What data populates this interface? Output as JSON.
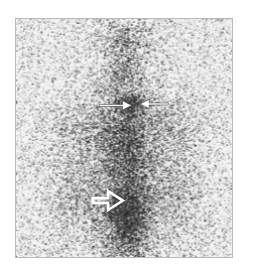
{
  "image": {
    "modality": "scintigraphy",
    "view": "anterior whole-body / torso",
    "frame": {
      "x": 15,
      "y": 18,
      "width": 218,
      "height": 240,
      "border_color": "#b9b9b9"
    },
    "background_color": "#ffffff",
    "field_background": "#f2f2f2"
  },
  "scan": {
    "noise": {
      "grain": "speckle",
      "density": 0.52,
      "dark_color": "#1c1c1c",
      "light_color": "#fdfdfd"
    },
    "anatomy": [
      {
        "name": "head",
        "cx": 0.5,
        "cy": 0.09,
        "rx": 0.115,
        "ry": 0.085,
        "intensity": 0.3
      },
      {
        "name": "neck",
        "cx": 0.5,
        "cy": 0.23,
        "rx": 0.075,
        "ry": 0.085,
        "intensity": 0.34
      },
      {
        "name": "thyroid-focus",
        "cx": 0.525,
        "cy": 0.355,
        "rx": 0.075,
        "ry": 0.035,
        "intensity": 0.78
      },
      {
        "name": "upper-thorax",
        "cx": 0.5,
        "cy": 0.46,
        "rx": 0.255,
        "ry": 0.155,
        "intensity": 0.33
      },
      {
        "name": "mediastinum-spine",
        "cx": 0.515,
        "cy": 0.56,
        "rx": 0.105,
        "ry": 0.255,
        "intensity": 0.44
      },
      {
        "name": "abdomen",
        "cx": 0.5,
        "cy": 0.72,
        "rx": 0.285,
        "ry": 0.215,
        "intensity": 0.31
      },
      {
        "name": "pelvic-bladder-focus",
        "cx": 0.505,
        "cy": 0.805,
        "rx": 0.095,
        "ry": 0.085,
        "intensity": 0.8
      },
      {
        "name": "lower-spine-column",
        "cx": 0.515,
        "cy": 0.92,
        "rx": 0.1,
        "ry": 0.135,
        "intensity": 0.55
      },
      {
        "name": "left-shoulder",
        "cx": 0.245,
        "cy": 0.46,
        "rx": 0.115,
        "ry": 0.105,
        "intensity": 0.17
      },
      {
        "name": "right-shoulder",
        "cx": 0.765,
        "cy": 0.46,
        "rx": 0.115,
        "ry": 0.105,
        "intensity": 0.17
      },
      {
        "name": "left-flank",
        "cx": 0.255,
        "cy": 0.75,
        "rx": 0.12,
        "ry": 0.165,
        "intensity": 0.18
      },
      {
        "name": "right-flank",
        "cx": 0.76,
        "cy": 0.75,
        "rx": 0.12,
        "ry": 0.165,
        "intensity": 0.18
      }
    ]
  },
  "annotations": {
    "arrows": [
      {
        "id": "arrow-left-solid",
        "style": "solid",
        "color": "#ffffff",
        "direction": "right",
        "tail": {
          "x": 0.385,
          "y": 0.363
        },
        "tip": {
          "x": 0.535,
          "y": 0.363
        },
        "points_at": "thyroid-focus"
      },
      {
        "id": "arrow-right-solid",
        "style": "solid",
        "color": "#ffffff",
        "direction": "left",
        "tail": {
          "x": 0.705,
          "y": 0.357
        },
        "tip": {
          "x": 0.575,
          "y": 0.357
        },
        "points_at": "thyroid-focus"
      },
      {
        "id": "arrow-lower-hollow",
        "style": "hollow",
        "color": "#ffffff",
        "direction": "right",
        "tail": {
          "x": 0.355,
          "y": 0.763
        },
        "tip": {
          "x": 0.495,
          "y": 0.763
        },
        "points_at": "pelvic-bladder-focus"
      }
    ]
  }
}
